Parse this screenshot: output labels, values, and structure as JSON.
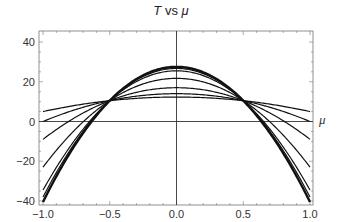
{
  "chart_data": {
    "type": "line",
    "title": "T vs μ",
    "title_parts": {
      "var1": "T",
      "mid": " vs ",
      "var2": "μ"
    },
    "xlabel": "μ",
    "ylabel": "",
    "xlim": [
      -1.0,
      1.0
    ],
    "ylim": [
      -40,
      40
    ],
    "xticks": [
      -1.0,
      -0.5,
      0.0,
      0.5,
      1.0
    ],
    "xtick_labels": [
      "−1.0",
      "−0.5",
      "0.0",
      "0.5",
      "1.0"
    ],
    "yticks": [
      -40,
      -20,
      0,
      20,
      40
    ],
    "ytick_labels": [
      "−40",
      "−20",
      "0",
      "20",
      "40"
    ],
    "grid": false,
    "legend": null,
    "series": [
      {
        "name": "curve-1",
        "a": 12.3,
        "b": 7.3,
        "x": [
          -1.0,
          -0.5,
          0.0,
          0.5,
          1.0
        ],
        "values": [
          5,
          10.5,
          12.3,
          10.5,
          5
        ]
      },
      {
        "name": "curve-2",
        "a": 14.0,
        "b": 14.0,
        "x": [
          -1.0,
          -0.5,
          0.0,
          0.5,
          1.0
        ],
        "values": [
          0,
          10.5,
          14.0,
          10.5,
          0
        ]
      },
      {
        "name": "curve-3",
        "a": 17.0,
        "b": 26.0,
        "x": [
          -1.0,
          -0.5,
          0.0,
          0.5,
          1.0
        ],
        "values": [
          -9,
          10.5,
          17.0,
          10.5,
          -9
        ]
      },
      {
        "name": "curve-4",
        "a": 21.7,
        "b": 44.7,
        "x": [
          -1.0,
          -0.5,
          0.0,
          0.5,
          1.0
        ],
        "values": [
          -23,
          10.5,
          21.7,
          10.5,
          -23
        ]
      },
      {
        "name": "curve-5",
        "a": 25.5,
        "b": 60.0,
        "x": [
          -1.0,
          -0.5,
          0.0,
          0.5,
          1.0
        ],
        "values": [
          -34.5,
          10.5,
          25.5,
          10.5,
          -34.5
        ]
      },
      {
        "name": "curve-6",
        "a": 26.7,
        "b": 64.7,
        "x": [
          -1.0,
          -0.5,
          0.0,
          0.5,
          1.0
        ],
        "values": [
          -38,
          10.5,
          26.7,
          10.5,
          -38
        ]
      },
      {
        "name": "curve-7",
        "a": 27.5,
        "b": 68.0,
        "x": [
          -1.0,
          -0.5,
          0.0,
          0.5,
          1.0
        ],
        "values": [
          -40.5,
          10.5,
          27.5,
          10.5,
          -40.5
        ],
        "thick": true
      }
    ]
  }
}
